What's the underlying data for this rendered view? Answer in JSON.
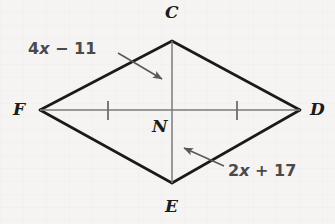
{
  "figure": {
    "type": "geometry-diagram",
    "shape_name": "kite FCDE",
    "background_color": "#f5f4f2",
    "outline_color": "#1a1a1a",
    "diagonal_color": "#777777",
    "label_color": "#4a4a4a",
    "vertex_label_color": "#1b1b1b",
    "vertices": [
      {
        "id": "C",
        "label": "C",
        "x": 172,
        "y": 41,
        "label_x": 165,
        "label_y": 4
      },
      {
        "id": "F",
        "label": "F",
        "x": 40,
        "y": 110,
        "label_x": 13,
        "label_y": 101
      },
      {
        "id": "D",
        "label": "D",
        "x": 300,
        "y": 110,
        "label_x": 310,
        "label_y": 101
      },
      {
        "id": "E",
        "label": "E",
        "x": 172,
        "y": 183,
        "label_x": 165,
        "label_y": 198
      },
      {
        "id": "N",
        "label": "N",
        "x": 172,
        "y": 110,
        "label_x": 152,
        "label_y": 118
      }
    ],
    "edges": [
      {
        "from": "F",
        "to": "C"
      },
      {
        "from": "C",
        "to": "D"
      },
      {
        "from": "D",
        "to": "E"
      },
      {
        "from": "E",
        "to": "F"
      }
    ],
    "diagonals": [
      {
        "from": "C",
        "to": "E"
      },
      {
        "from": "F",
        "to": "D"
      }
    ],
    "tick_marks": [
      {
        "on_segment": "FN",
        "x": 108,
        "y": 110
      },
      {
        "on_segment": "ND",
        "x": 237,
        "y": 110
      }
    ],
    "annotations": [
      {
        "id": "segment-cn-measure",
        "text": "4x − 11",
        "expression_prefix": "4",
        "expression_variable": "x",
        "expression_suffix": " − 11",
        "label_x": 28,
        "label_y": 41,
        "points_to_segment": "CN",
        "arrow_start_x": 118,
        "arrow_start_y": 53,
        "arrow_end_x": 165,
        "arrow_end_y": 81
      },
      {
        "id": "segment-ne-measure",
        "text": "2x + 17",
        "expression_prefix": "2",
        "expression_variable": "x",
        "expression_suffix": " + 17",
        "label_x": 228,
        "label_y": 163,
        "points_to_segment": "NE",
        "arrow_start_x": 224,
        "arrow_start_y": 166,
        "arrow_end_x": 180,
        "arrow_end_y": 146
      }
    ]
  }
}
